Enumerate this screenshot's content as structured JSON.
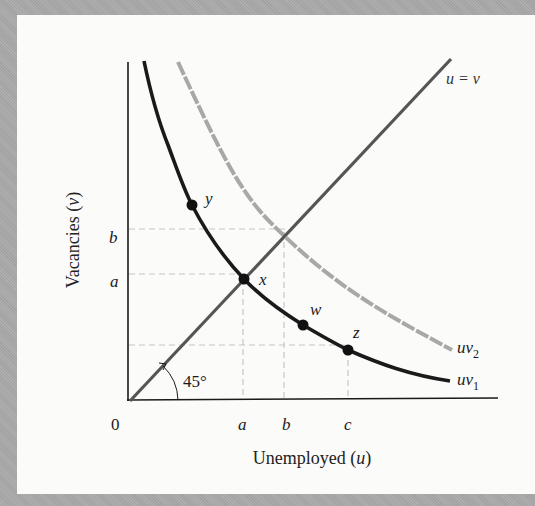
{
  "figure": {
    "type": "Beveridge curve diagram",
    "x_axis": {
      "label_text": "Unemployed (",
      "label_var": "u",
      "label_close": ")",
      "origin_label": "0",
      "ticks": [
        "a",
        "b",
        "c"
      ]
    },
    "y_axis": {
      "label_text": "Vacancies (",
      "label_var": "v",
      "label_close": ")",
      "ticks": [
        "b",
        "a"
      ]
    },
    "lines": {
      "diagonal": {
        "label": "u =  v",
        "angle_label": "45°",
        "color": "#555555"
      },
      "uv1": {
        "label_base": "uv",
        "label_sub": "1",
        "color": "#1a1a1a"
      },
      "uv2": {
        "label_base": "uv",
        "label_sub": "2",
        "color": "#a8a8a8"
      }
    },
    "points": [
      {
        "id": "y",
        "label": "y"
      },
      {
        "id": "x",
        "label": "x"
      },
      {
        "id": "w",
        "label": "w"
      },
      {
        "id": "z",
        "label": "z"
      }
    ],
    "colors": {
      "background": "#a9a9a9",
      "panel": "#fbfbfa",
      "guide": "#c8c8c8",
      "axis": "#1a1a1a"
    }
  }
}
